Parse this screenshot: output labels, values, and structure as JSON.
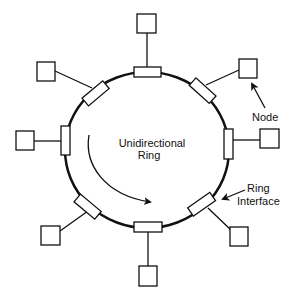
{
  "diagram": {
    "type": "token-ring-network",
    "labels": {
      "center_line1": "Unidirectional",
      "center_line2": "Ring",
      "node_callout": "Node",
      "interface_callout_line1": "Ring",
      "interface_callout_line2": "Interface"
    },
    "node_count": 8,
    "interface_count": 8,
    "colors": {
      "stroke": "#111111",
      "background": "#ffffff"
    }
  }
}
